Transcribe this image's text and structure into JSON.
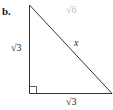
{
  "figure": {
    "part_label": "b.",
    "faded_label": "√6",
    "shape": "right-triangle",
    "right_angle_marker": true,
    "sides": {
      "left_leg": "√3",
      "hypotenuse": "x",
      "base_leg": "√3"
    },
    "colors": {
      "stroke": "#333333",
      "faded_text": "#b8b8b8",
      "text": "#1a1a1a"
    }
  }
}
